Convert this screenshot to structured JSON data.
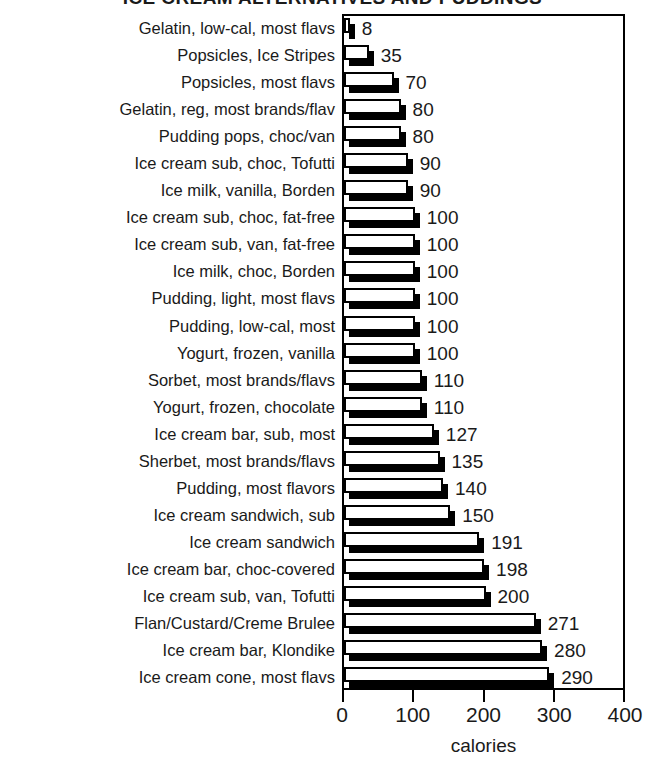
{
  "chart_data": {
    "type": "bar",
    "orientation": "horizontal",
    "title": "ICE CREAM ALTERNATIVES AND PUDDINGS",
    "xlabel": "calories",
    "ylabel": "",
    "xlim": [
      0,
      400
    ],
    "xticks": [
      0,
      100,
      200,
      300,
      400
    ],
    "xtick_labels": [
      "0",
      "100",
      "200",
      "300",
      "400"
    ],
    "grid": false,
    "legend": false,
    "show_value_labels": true,
    "categories": [
      "Gelatin, low-cal, most flavs",
      "Popsicles, Ice Stripes",
      "Popsicles, most flavs",
      "Gelatin, reg, most brands/flav",
      "Pudding pops, choc/van",
      "Ice cream sub, choc, Tofutti",
      "Ice milk, vanilla, Borden",
      "Ice cream sub, choc, fat-free",
      "Ice cream sub, van, fat-free",
      "Ice milk, choc, Borden",
      "Pudding, light, most flavs",
      "Pudding, low-cal, most",
      "Yogurt, frozen, vanilla",
      "Sorbet, most brands/flavs",
      "Yogurt, frozen, chocolate",
      "Ice cream bar, sub, most",
      "Sherbet, most brands/flavs",
      "Pudding, most flavors",
      "Ice cream sandwich, sub",
      "Ice cream sandwich",
      "Ice cream bar, choc-covered",
      "Ice cream sub, van, Tofutti",
      "Flan/Custard/Creme Brulee",
      "Ice cream bar, Klondike",
      "Ice cream cone, most flavs"
    ],
    "values": [
      8,
      35,
      70,
      80,
      80,
      90,
      90,
      100,
      100,
      100,
      100,
      100,
      100,
      110,
      110,
      127,
      135,
      140,
      150,
      191,
      198,
      200,
      271,
      280,
      290
    ],
    "value_labels": [
      "8",
      "35",
      "70",
      "80",
      "80",
      "90",
      "90",
      "100",
      "100",
      "100",
      "100",
      "100",
      "100",
      "110",
      "110",
      "127",
      "135",
      "140",
      "150",
      "191",
      "198",
      "200",
      "271",
      "280",
      "290"
    ],
    "colors": {
      "bar_face": "#ffffff",
      "bar_outline": "#000000",
      "bar_shadow": "#000000",
      "text": "#1a1a1a",
      "axis": "#000000"
    }
  }
}
